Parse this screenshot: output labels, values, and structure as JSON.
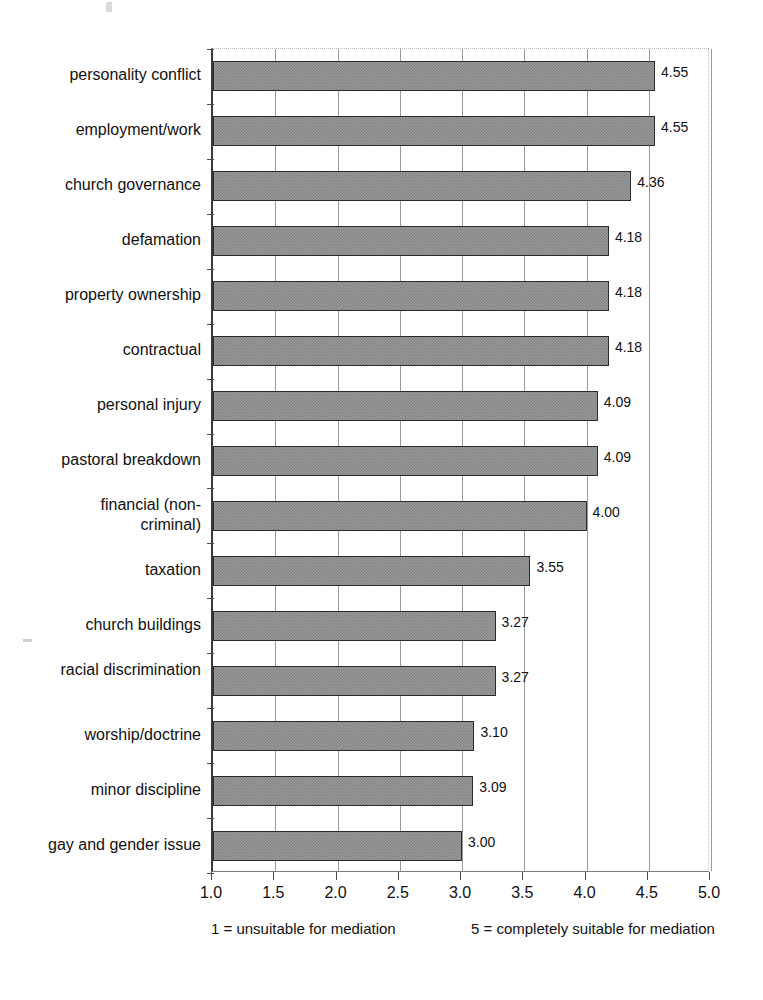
{
  "chart_data": {
    "type": "bar",
    "orientation": "horizontal",
    "title": "",
    "subtitle": "",
    "xlabel": "",
    "ylabel": "",
    "xlim": [
      1.0,
      5.0
    ],
    "xticks": [
      "1.0",
      "1.5",
      "2.0",
      "2.5",
      "3.0",
      "3.5",
      "4.0",
      "4.5",
      "5.0"
    ],
    "xtick_values": [
      1.0,
      1.5,
      2.0,
      2.5,
      3.0,
      3.5,
      4.0,
      4.5,
      5.0
    ],
    "grid": true,
    "grid_axis": "x",
    "legend": "none",
    "bar_color": "#9b9b9b",
    "bar_border_color": "#2b2b2b",
    "categories": [
      "personality conflict",
      "employment/work",
      "church governance",
      "defamation",
      "property ownership",
      "contractual",
      "personal injury",
      "pastoral breakdown",
      "financial (non-criminal)",
      "taxation",
      "church buildings",
      "racial discrimination",
      "worship/doctrine",
      "minor discipline",
      "gay and gender issue"
    ],
    "values": [
      4.55,
      4.55,
      4.36,
      4.18,
      4.18,
      4.18,
      4.09,
      4.09,
      4.0,
      3.55,
      3.27,
      3.27,
      3.1,
      3.09,
      3.0
    ],
    "value_labels": [
      "4.55",
      "4.55",
      "4.36",
      "4.18",
      "4.18",
      "4.18",
      "4.09",
      "4.09",
      "4.00",
      "3.55",
      "3.27",
      "3.27",
      "3.10",
      "3.09",
      "3.00"
    ],
    "annotations": [
      "1 = unsuitable for mediation",
      "5 = completely suitable for mediation"
    ]
  },
  "axis_caption": {
    "left": "1 = unsuitable for mediation",
    "right": "5 = completely suitable for mediation"
  }
}
